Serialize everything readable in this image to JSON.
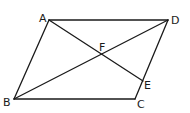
{
  "figure": {
    "type": "geometry-parallelogram",
    "points": {
      "A": {
        "label": "A",
        "x": 49,
        "y": 20,
        "lx": 39,
        "ly": 22
      },
      "D": {
        "label": "D",
        "x": 168,
        "y": 20,
        "lx": 171,
        "ly": 24
      },
      "B": {
        "label": "B",
        "x": 14,
        "y": 99,
        "lx": 3,
        "ly": 106
      },
      "C": {
        "label": "C",
        "x": 135,
        "y": 99,
        "lx": 137,
        "ly": 108
      },
      "E": {
        "label": "E",
        "x": 143,
        "y": 81,
        "lx": 144,
        "ly": 89
      },
      "F": {
        "label": "F",
        "x": 102,
        "y": 55,
        "lx": 99,
        "ly": 51
      }
    },
    "segments": [
      {
        "name": "side-AD",
        "from": "A",
        "to": "D"
      },
      {
        "name": "side-DC",
        "from": "D",
        "to": "C"
      },
      {
        "name": "side-CB",
        "from": "C",
        "to": "B"
      },
      {
        "name": "side-BA",
        "from": "B",
        "to": "A"
      },
      {
        "name": "diagonal-BD",
        "from": "B",
        "to": "D"
      },
      {
        "name": "segment-AE",
        "from": "A",
        "to": "E"
      }
    ],
    "colors": {
      "stroke": "#1a1a1a",
      "background": "#ffffff"
    }
  }
}
